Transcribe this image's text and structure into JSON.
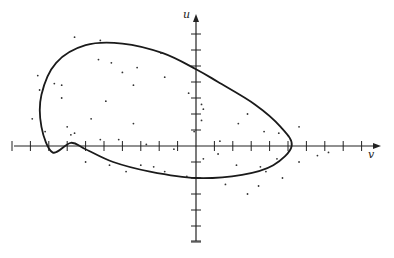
{
  "chart_data": {
    "type": "scatter",
    "title": "",
    "xlabel": "v",
    "ylabel": "u",
    "grid": false,
    "legend": null,
    "origin_px": [
      196,
      146
    ],
    "x_tick_spacing_px": 18.4,
    "y_tick_spacing_px": 16,
    "x_ticks": [
      -10,
      -9,
      -8,
      -7,
      -6,
      -5,
      -4,
      -3,
      -2,
      -1,
      1,
      2,
      3,
      4,
      5,
      6,
      7,
      8,
      9
    ],
    "y_ticks": [
      -6,
      -5,
      -4,
      -3,
      -2,
      -1,
      1,
      2,
      3,
      4,
      5,
      6,
      7
    ],
    "xlim": [
      -10,
      10
    ],
    "ylim": [
      -6,
      8
    ],
    "curve": {
      "name": "closed boundary curve",
      "shape": "egg-shaped closed loop, tilted, wider on the left",
      "points": [
        [
          5.2,
          0
        ],
        [
          4.6,
          1.2
        ],
        [
          3.2,
          2.6
        ],
        [
          1.2,
          4.0
        ],
        [
          0,
          4.8
        ],
        [
          -1.8,
          5.8
        ],
        [
          -4.0,
          6.4
        ],
        [
          -6.0,
          6.3
        ],
        [
          -7.6,
          5.2
        ],
        [
          -8.4,
          3.2
        ],
        [
          -8.4,
          1.2
        ],
        [
          -7.8,
          -0.4
        ],
        [
          -6.8,
          0.2
        ],
        [
          -6.0,
          -0.2
        ],
        [
          -4.5,
          -1.0
        ],
        [
          -2.5,
          -1.6
        ],
        [
          0,
          -2.0
        ],
        [
          2.5,
          -1.8
        ],
        [
          4.2,
          -1.2
        ],
        [
          5.2,
          0
        ]
      ]
    },
    "scatter_points": [
      [
        -6.6,
        6.8
      ],
      [
        -5.2,
        6.6
      ],
      [
        -5.3,
        5.4
      ],
      [
        -4.6,
        5.2
      ],
      [
        -1.9,
        5.8
      ],
      [
        -3.2,
        4.9
      ],
      [
        -4.0,
        4.6
      ],
      [
        -8.6,
        4.4
      ],
      [
        -7.7,
        3.9
      ],
      [
        -7.3,
        3.8
      ],
      [
        -3.4,
        3.8
      ],
      [
        -1.7,
        4.3
      ],
      [
        -8.5,
        3.5
      ],
      [
        -0.4,
        3.3
      ],
      [
        0.3,
        2.6
      ],
      [
        0.4,
        2.3
      ],
      [
        0.3,
        1.6
      ],
      [
        2.8,
        2.0
      ],
      [
        -7.3,
        3.0
      ],
      [
        -4.9,
        2.8
      ],
      [
        -5.7,
        1.7
      ],
      [
        -8.9,
        1.7
      ],
      [
        -8.2,
        0.9
      ],
      [
        -7.0,
        1.2
      ],
      [
        -5.2,
        0.4
      ],
      [
        -4.2,
        0.4
      ],
      [
        -3.4,
        1.4
      ],
      [
        -0.1,
        0.9
      ],
      [
        1.3,
        0.3
      ],
      [
        2.3,
        1.4
      ],
      [
        3.7,
        0.9
      ],
      [
        4.5,
        0.8
      ],
      [
        5.6,
        1.2
      ],
      [
        -6.6,
        0.8
      ],
      [
        -2.7,
        0.1
      ],
      [
        -1.2,
        -0.2
      ],
      [
        1.2,
        -0.5
      ],
      [
        -6.8,
        0.7
      ],
      [
        -3.0,
        -1.2
      ],
      [
        -3.8,
        -1.6
      ],
      [
        -1.7,
        -1.6
      ],
      [
        -0.5,
        -1.9
      ],
      [
        0.4,
        -0.8
      ],
      [
        2.2,
        -1.2
      ],
      [
        3.5,
        -1.3
      ],
      [
        3.8,
        -1.6
      ],
      [
        4.4,
        -0.8
      ],
      [
        5.6,
        -1.0
      ],
      [
        4.7,
        -2.0
      ],
      [
        1.6,
        -2.4
      ],
      [
        6.6,
        -0.6
      ],
      [
        7.2,
        -0.4
      ],
      [
        -2.3,
        -1.3
      ],
      [
        -4.7,
        -1.2
      ],
      [
        2.8,
        -3.0
      ],
      [
        3.4,
        -2.5
      ],
      [
        -6.0,
        -1.0
      ]
    ]
  },
  "axes": {
    "u_label": "u",
    "v_label": "v"
  }
}
